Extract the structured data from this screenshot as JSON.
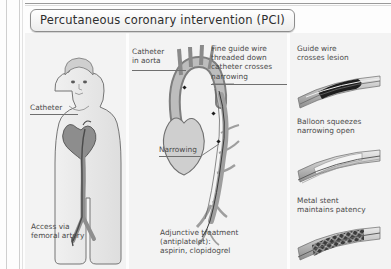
{
  "figure": {
    "title": "Percutaneous coronary intervention (PCI)"
  },
  "panels": {
    "left": {
      "name": "patient-torso-panel",
      "labels": {
        "catheter": "Catheter",
        "access": "Access via\nfemoral artery"
      }
    },
    "middle": {
      "name": "aorta-coronary-panel",
      "labels": {
        "catheter_in_aorta": "Catheter\nin aorta",
        "guide_wire": "Fine guide wire\nthreaded down\ncatheter crosses\nnarrowing",
        "narrowing": "Narrowing",
        "adjunctive": "Adjunctive treatment\n(antiplatelet):\naspirin, clopidogrel"
      }
    },
    "right": {
      "name": "vessel-steps-panel",
      "steps": [
        {
          "label": "Guide wire\ncrosses lesion",
          "icon": "vessel-guidewire-icon"
        },
        {
          "label": "Balloon squeezes\nnarrowing open",
          "icon": "vessel-balloon-icon"
        },
        {
          "label": "Metal stent\nmaintains patency",
          "icon": "vessel-stent-icon"
        }
      ]
    }
  },
  "colors": {
    "panel_bg": "#f3f3f3",
    "ink": "#4a4a4a",
    "vessel_dark": "#2b2b2b",
    "vessel_light": "#d8d8d8"
  }
}
